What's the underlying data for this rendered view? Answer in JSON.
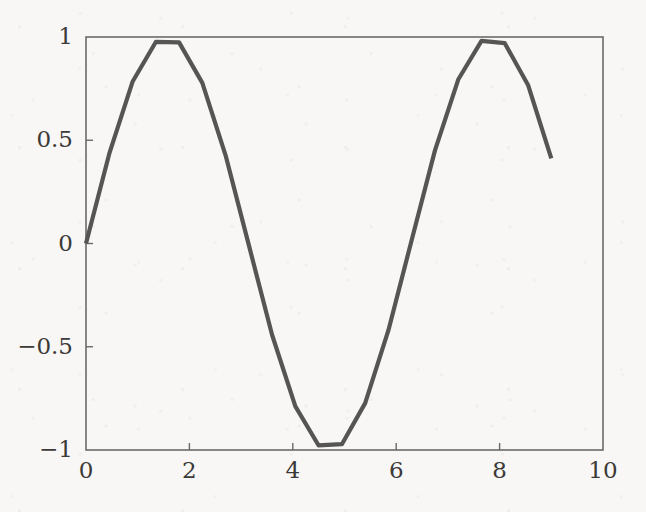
{
  "figure": {
    "background_color": "#f8f7f5",
    "frame_color": "#6a6a6a",
    "label_color": "#3c3a38"
  },
  "chart_data": {
    "type": "line",
    "title": "",
    "subtitle": "",
    "xlabel": "",
    "ylabel": "",
    "xlim": [
      0,
      10
    ],
    "ylim": [
      -1,
      1
    ],
    "grid": false,
    "legend": [],
    "legend_position": "none",
    "xticks": [
      0,
      2,
      4,
      6,
      8,
      10
    ],
    "xticklabels": [
      "0",
      "2",
      "4",
      "6",
      "8",
      "10"
    ],
    "yticks": [
      -1,
      -0.5,
      0,
      0.5,
      1
    ],
    "yticklabels": [
      "−1",
      "−0.5",
      "0",
      "0.5",
      "1"
    ],
    "series": [
      {
        "name": "sin(x)",
        "color": "#555555",
        "line_width": 4.2,
        "x": [
          0,
          0.45,
          0.9,
          1.35,
          1.8,
          2.25,
          2.7,
          3.15,
          3.6,
          4.05,
          4.5,
          4.95,
          5.4,
          5.85,
          6.3,
          6.75,
          7.2,
          7.65,
          8.1,
          8.55,
          9.0
        ],
        "y": [
          0.0,
          0.435,
          0.783,
          0.976,
          0.974,
          0.778,
          0.427,
          -0.008,
          -0.443,
          -0.789,
          -0.978,
          -0.972,
          -0.773,
          -0.42,
          0.017,
          0.451,
          0.794,
          0.981,
          0.97,
          0.768,
          0.412
        ]
      }
    ]
  }
}
